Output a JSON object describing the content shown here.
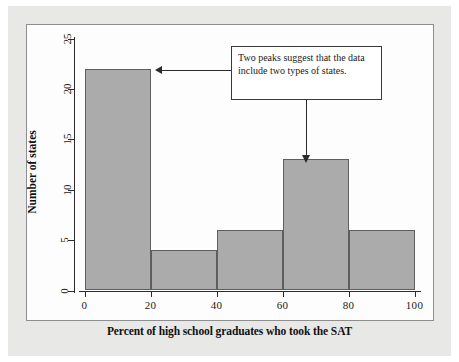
{
  "chart_data": {
    "type": "bar",
    "title": "",
    "xlabel": "Percent of high school graduates who took the SAT",
    "ylabel": "Number of states",
    "categories": [
      "0-20",
      "20-40",
      "40-60",
      "60-80",
      "80-100"
    ],
    "bin_edges": [
      0,
      20,
      40,
      60,
      80,
      100
    ],
    "values": [
      22,
      4,
      6,
      13,
      6
    ],
    "xlim": [
      0,
      100
    ],
    "ylim": [
      0,
      25
    ],
    "xticks": [
      "0",
      "20",
      "40",
      "60",
      "80",
      "100"
    ],
    "yticks": [
      "0",
      "5",
      "10",
      "15",
      "20",
      "25"
    ],
    "grid": false,
    "legend": "none",
    "bar_color": "#ababab",
    "bar_border_color": "#5e5e5e",
    "axis_color": "#2b2b2b",
    "panel_background": "#fdfdfd",
    "page_background": "#e8e8e6",
    "annotations": [
      {
        "text": "Two peaks suggest that the data include two types of states.",
        "points_to": [
          "bin 0-20 (value 22)",
          "bin 60-80 (value 13)"
        ]
      }
    ]
  },
  "figure": {
    "x_axis_title": "Percent of high school graduates who took the SAT",
    "y_axis_title": "Number of states",
    "x_tick_labels": [
      "0",
      "20",
      "40",
      "60",
      "80",
      "100"
    ],
    "y_tick_labels": [
      "0",
      "5",
      "10",
      "15",
      "20",
      "25"
    ],
    "annotation_text": "Two peaks suggest that the data include two types of states."
  }
}
